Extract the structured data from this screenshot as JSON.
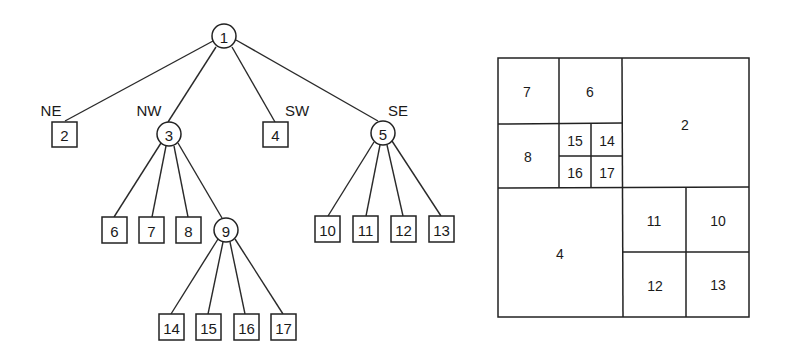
{
  "tree": {
    "root": "1",
    "direction_labels": {
      "ne": "NE",
      "nw": "NW",
      "sw": "SW",
      "se": "SE"
    },
    "nodes": {
      "n1": "1",
      "n2": "2",
      "n3": "3",
      "n4": "4",
      "n5": "5",
      "n6": "6",
      "n7": "7",
      "n8": "8",
      "n9": "9",
      "n10": "10",
      "n11": "11",
      "n12": "12",
      "n13": "13",
      "n14": "14",
      "n15": "15",
      "n16": "16",
      "n17": "17"
    },
    "internal_nodes": [
      "1",
      "3",
      "5",
      "9"
    ],
    "leaf_nodes": [
      "2",
      "4",
      "6",
      "7",
      "8",
      "10",
      "11",
      "12",
      "13",
      "14",
      "15",
      "16",
      "17"
    ],
    "edges": [
      [
        "1",
        "2"
      ],
      [
        "1",
        "3"
      ],
      [
        "1",
        "4"
      ],
      [
        "1",
        "5"
      ],
      [
        "3",
        "6"
      ],
      [
        "3",
        "7"
      ],
      [
        "3",
        "8"
      ],
      [
        "3",
        "9"
      ],
      [
        "5",
        "10"
      ],
      [
        "5",
        "11"
      ],
      [
        "5",
        "12"
      ],
      [
        "5",
        "13"
      ],
      [
        "9",
        "14"
      ],
      [
        "9",
        "15"
      ],
      [
        "9",
        "16"
      ],
      [
        "9",
        "17"
      ]
    ]
  },
  "quadtree": {
    "cells": {
      "c7": "7",
      "c6": "6",
      "c2": "2",
      "c8": "8",
      "c15": "15",
      "c14": "14",
      "c16": "16",
      "c17": "17",
      "c4": "4",
      "c11": "11",
      "c10": "10",
      "c12": "12",
      "c13": "13"
    }
  }
}
